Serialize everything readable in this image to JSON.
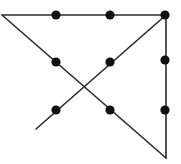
{
  "figure": {
    "canvas": {
      "width": 181,
      "height": 164
    },
    "background_color": "#ffffff",
    "line_color": "#2a2a2a",
    "dot_color": "#111111",
    "line_width": 1.6,
    "dot_radius": 4.6,
    "segments": [
      {
        "name": "top-horizontal-segment",
        "x1": 2,
        "y1": 15,
        "x2": 166,
        "y2": 15
      },
      {
        "name": "right-vertical-segment",
        "x1": 166,
        "y1": 15,
        "x2": 166,
        "y2": 158
      },
      {
        "name": "main-diagonal-down-right-segment",
        "x1": 2,
        "y1": 15,
        "x2": 166,
        "y2": 158
      },
      {
        "name": "cross-diagonal-down-left-segment",
        "x1": 166,
        "y1": 15,
        "x2": 36,
        "y2": 129
      }
    ],
    "points": [
      {
        "name": "point-top-left-corner",
        "x": 2,
        "y": 15,
        "marked": false
      },
      {
        "name": "point-top-middle-left",
        "x": 56,
        "y": 15,
        "marked": true
      },
      {
        "name": "point-top-middle-right",
        "x": 110,
        "y": 15,
        "marked": true
      },
      {
        "name": "point-top-right-corner",
        "x": 165,
        "y": 15,
        "marked": true
      },
      {
        "name": "point-upper-left-diagonal",
        "x": 56,
        "y": 62,
        "marked": true
      },
      {
        "name": "point-upper-right-diagonal",
        "x": 110,
        "y": 62,
        "marked": true
      },
      {
        "name": "point-right-edge-upper",
        "x": 165,
        "y": 60,
        "marked": true
      },
      {
        "name": "point-lower-left-diagonal",
        "x": 56,
        "y": 110,
        "marked": true
      },
      {
        "name": "point-lower-right-diagonal",
        "x": 110,
        "y": 110,
        "marked": true
      },
      {
        "name": "point-right-edge-lower",
        "x": 165,
        "y": 110,
        "marked": true
      },
      {
        "name": "point-bottom-left-open-end",
        "x": 36,
        "y": 129,
        "marked": false
      },
      {
        "name": "point-bottom-right-corner",
        "x": 166,
        "y": 158,
        "marked": false
      }
    ]
  }
}
